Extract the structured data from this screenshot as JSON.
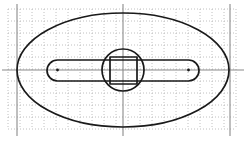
{
  "canvas": {
    "width": 246,
    "height": 150,
    "background_color": "#ffffff",
    "title": "Engineering sketch: elliptical plate with central slot, boss circle and square"
  },
  "grid": {
    "label": "dotted-graph-grid",
    "style": "dotted",
    "spacing_px": 12,
    "color": "#b9b9b9",
    "x_start": 8,
    "x_end": 236,
    "y_start": 9,
    "y_end": 129,
    "vertical_count": 20,
    "horizontal_count": 11
  },
  "guides": {
    "label": "construction-axes",
    "color": "#8a8a8a",
    "vertical_x": [
      17,
      123,
      230
    ],
    "horizontal_y": [
      70
    ]
  },
  "shapes": {
    "ellipse": {
      "name": "outer-ellipse",
      "cx": 123,
      "cy": 70,
      "rx": 106,
      "ry": 57,
      "stroke": "#1a1a1a"
    },
    "slot": {
      "name": "horizontal-slot",
      "x": 47,
      "y": 60,
      "width": 152,
      "height": 21,
      "corner_radius": 10.5,
      "stroke": "#1a1a1a"
    },
    "circle": {
      "name": "center-boss-circle",
      "cx": 123,
      "cy": 70,
      "r": 21,
      "stroke": "#1a1a1a"
    },
    "square": {
      "name": "center-square",
      "x": 110,
      "y": 57,
      "width": 27,
      "height": 27,
      "stroke": "#1a1a1a"
    },
    "slot_end_points": {
      "name": "slot-end-center-marks",
      "radius": 1.4,
      "left_cx": 57.5,
      "right_cx": 188.5,
      "cy": 70,
      "color": "#1a1a1a"
    }
  },
  "chart_data": {
    "type": "table",
    "xlabel": "",
    "ylabel": "",
    "categories": [
      "outer-ellipse",
      "horizontal-slot",
      "center-boss-circle",
      "center-square"
    ],
    "values": [
      106,
      152,
      21,
      27
    ]
  }
}
